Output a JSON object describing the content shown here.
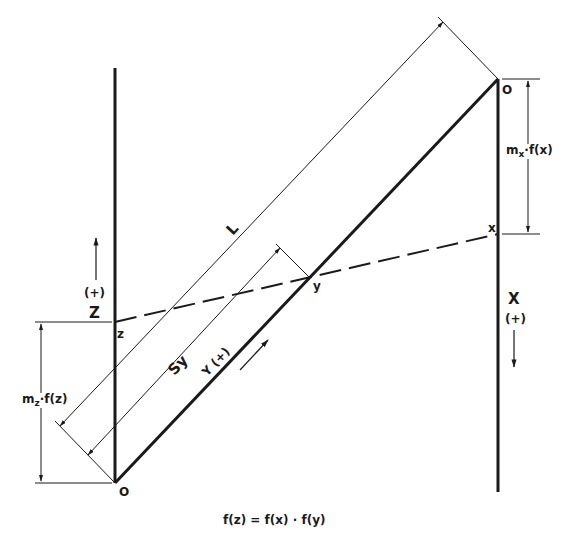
{
  "diagram": {
    "formula": "f(z) = f(x) · f(y)",
    "axes": {
      "z": {
        "label": "Z",
        "direction": "(+)",
        "origin_label": "O",
        "point_label": "z"
      },
      "x": {
        "label": "X",
        "direction": "(+)",
        "origin_label": "O",
        "point_label": "x"
      },
      "y": {
        "label": "Y (+)",
        "point_label": "y"
      }
    },
    "dimensions": {
      "L": "L",
      "Sy": "Sy",
      "mz": {
        "m": "m",
        "sub": "z",
        "rest": "·f(z)"
      },
      "mx": {
        "m": "m",
        "sub": "x",
        "rest": "·f(x)"
      }
    },
    "colors": {
      "ink": "#1a1a1a",
      "background": "#ffffff"
    }
  }
}
